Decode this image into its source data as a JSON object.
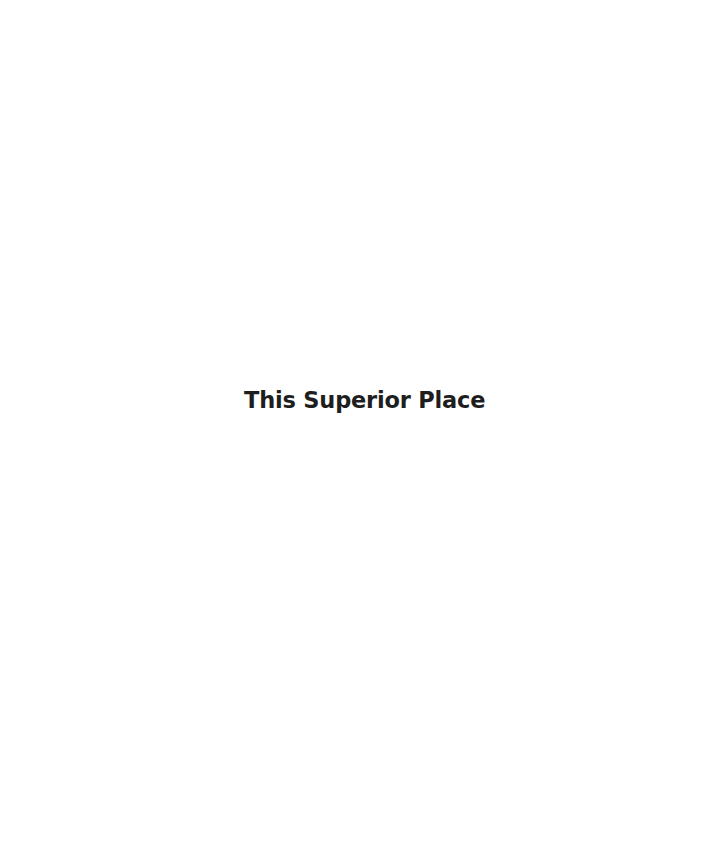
{
  "page": {
    "title": "This Superior Place",
    "background_color": "#ffffff",
    "text_color": "#1e1e1e"
  }
}
